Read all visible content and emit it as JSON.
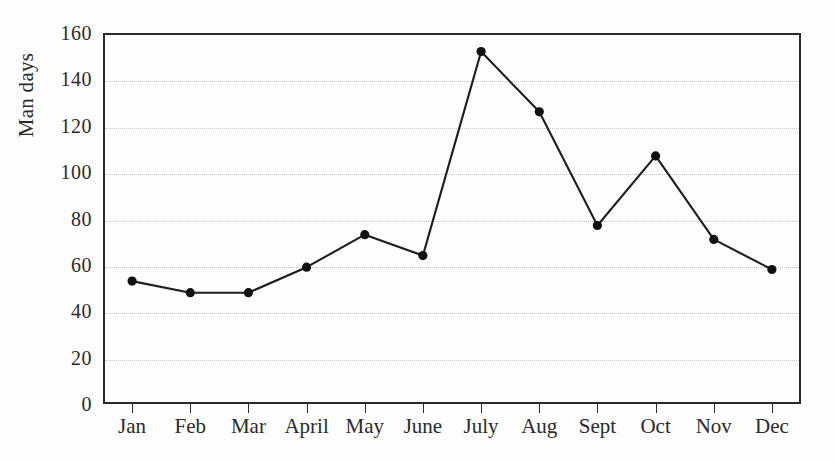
{
  "chart_data": {
    "type": "line",
    "title": "",
    "xlabel": "",
    "ylabel": "Man days",
    "categories": [
      "Jan",
      "Feb",
      "Mar",
      "April",
      "May",
      "June",
      "July",
      "Aug",
      "Sept",
      "Oct",
      "Nov",
      "Dec"
    ],
    "values": [
      53,
      48,
      48,
      59,
      73,
      64,
      152,
      126,
      77,
      107,
      71,
      58
    ],
    "series": [
      {
        "name": "Man days",
        "values": [
          53,
          48,
          48,
          59,
          73,
          64,
          152,
          126,
          77,
          107,
          71,
          58
        ]
      }
    ],
    "ylim": [
      0,
      160
    ],
    "yticks": [
      0,
      20,
      40,
      60,
      80,
      100,
      120,
      140,
      160
    ],
    "ytick_labels": [
      "0",
      "20",
      "40",
      "60",
      "80",
      "100",
      "120",
      "140",
      "160"
    ],
    "grid": true,
    "grid_axis": "y",
    "legend": false,
    "marker": "filled-circle",
    "line_color": "#1e1e1e",
    "marker_color": "#111111",
    "grid_color": "#c6c6c6",
    "axis_color": "#2a2a2a",
    "background_color": "#fdfdfd"
  }
}
